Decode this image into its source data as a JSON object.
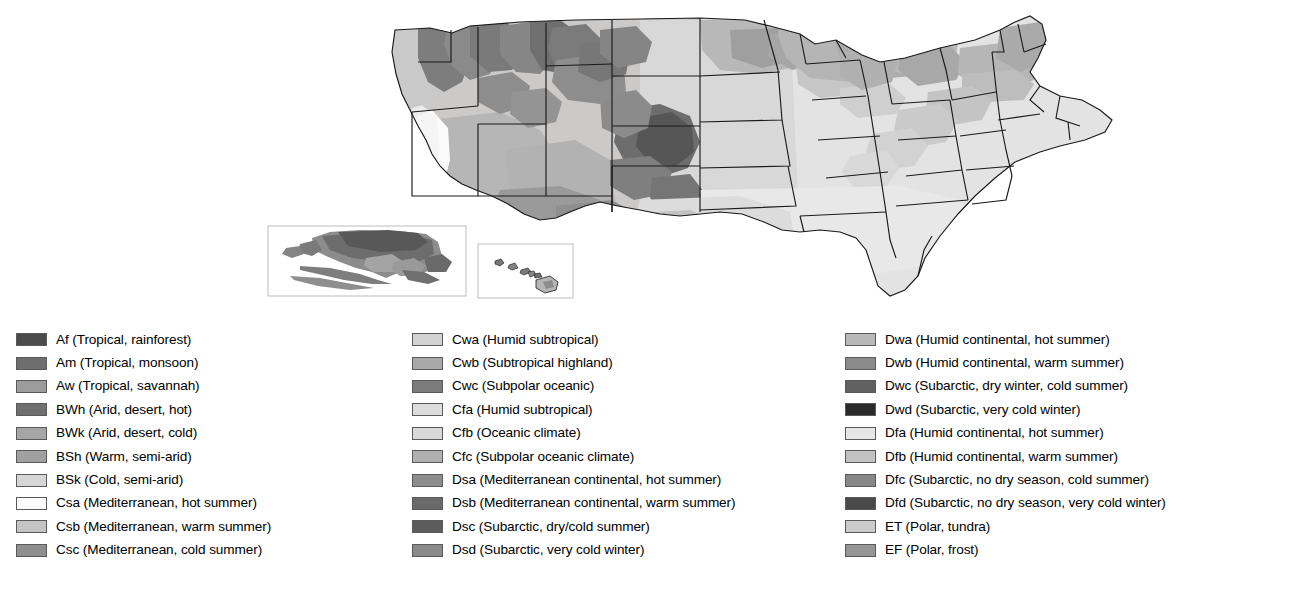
{
  "map": {
    "title": "Köppen climate classification map of the United States",
    "insets": [
      {
        "name": "alaska-inset",
        "label": "Alaska"
      },
      {
        "name": "hawaii-inset",
        "label": "Hawaii"
      }
    ],
    "colors": {
      "background": "#ffffff",
      "outline": "#1a1a1a",
      "state_border": "#1a1a1a",
      "fill_light": "#e3e3e3",
      "fill_mid_light": "#cfcfcf",
      "fill_mid": "#b4b4b4",
      "fill_mid_dark": "#9a9a9a",
      "fill_dark": "#7d7d7d",
      "fill_darker": "#636363",
      "fill_white": "#fbfbfb"
    }
  },
  "legend": {
    "columns": [
      {
        "name": "legend-column-a-b-c",
        "items": [
          {
            "code": "Af",
            "label": "Af (Tropical, rainforest)",
            "color": "#4b4b4b"
          },
          {
            "code": "Am",
            "label": "Am (Tropical, monsoon)",
            "color": "#6e6e6e"
          },
          {
            "code": "Aw",
            "label": "Aw (Tropical, savannah)",
            "color": "#9c9c9c"
          },
          {
            "code": "BWh",
            "label": "BWh (Arid, desert, hot)",
            "color": "#6f6f6f"
          },
          {
            "code": "BWk",
            "label": "BWk (Arid, desert, cold)",
            "color": "#a6a6a6"
          },
          {
            "code": "BSh",
            "label": "BSh (Warm, semi-arid)",
            "color": "#a0a0a0"
          },
          {
            "code": "BSk",
            "label": "BSk (Cold, semi-arid)",
            "color": "#d6d6d6"
          },
          {
            "code": "Csa",
            "label": "Csa (Mediterranean, hot summer)",
            "color": "#fbfbfb"
          },
          {
            "code": "Csb",
            "label": "Csb (Mediterranean, warm summer)",
            "color": "#c4c4c4"
          },
          {
            "code": "Csc",
            "label": "Csc (Mediterranean, cold summer)",
            "color": "#8f8f8f"
          }
        ]
      },
      {
        "name": "legend-column-c-d",
        "items": [
          {
            "code": "Cwa",
            "label": "Cwa (Humid subtropical)",
            "color": "#d2d2d2"
          },
          {
            "code": "Cwb",
            "label": "Cwb (Subtropical highland)",
            "color": "#a9a9a9"
          },
          {
            "code": "Cwc",
            "label": "Cwc (Subpolar oceanic)",
            "color": "#7b7b7b"
          },
          {
            "code": "Cfa",
            "label": "Cfa (Humid subtropical)",
            "color": "#dcdcdc"
          },
          {
            "code": "Cfb",
            "label": "Cfb (Oceanic climate)",
            "color": "#d9d9d9"
          },
          {
            "code": "Cfc",
            "label": "Cfc (Subpolar oceanic climate)",
            "color": "#b0b0b0"
          },
          {
            "code": "Dsa",
            "label": "Dsa (Mediterranean continental, hot summer)",
            "color": "#8d8d8d"
          },
          {
            "code": "Dsb",
            "label": "Dsb (Mediterranean continental, warm summer)",
            "color": "#6a6a6a"
          },
          {
            "code": "Dsc",
            "label": "Dsc (Subarctic, dry/cold summer)",
            "color": "#5c5c5c"
          },
          {
            "code": "Dsd",
            "label": "Dsd (Subarctic, very cold winter)",
            "color": "#8a8a8a"
          }
        ]
      },
      {
        "name": "legend-column-d-e",
        "items": [
          {
            "code": "Dwa",
            "label": "Dwa (Humid continental, hot summer)",
            "color": "#b8b8b8"
          },
          {
            "code": "Dwb",
            "label": "Dwb (Humid continental, warm summer)",
            "color": "#8b8b8b"
          },
          {
            "code": "Dwc",
            "label": "Dwc (Subarctic, dry winter, cold summer)",
            "color": "#606060"
          },
          {
            "code": "Dwd",
            "label": "Dwd (Subarctic, very cold winter)",
            "color": "#2b2b2b"
          },
          {
            "code": "Dfa",
            "label": "Dfa (Humid continental, hot summer)",
            "color": "#e6e6e6"
          },
          {
            "code": "Dfb",
            "label": "Dfb (Humid continental, warm summer)",
            "color": "#c2c2c2"
          },
          {
            "code": "Dfc",
            "label": "Dfc (Subarctic, no dry season, cold summer)",
            "color": "#888888"
          },
          {
            "code": "Dfd",
            "label": "Dfd (Subarctic, no dry season, very cold winter)",
            "color": "#4a4a4a"
          },
          {
            "code": "ET",
            "label": "ET (Polar, tundra)",
            "color": "#cbcbcb"
          },
          {
            "code": "EF",
            "label": "EF (Polar, frost)",
            "color": "#969696"
          }
        ]
      }
    ]
  }
}
